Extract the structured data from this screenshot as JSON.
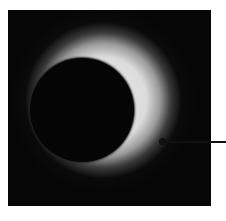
{
  "figure": {
    "colors": {
      "background": "#060606",
      "halo": "#e0e0e0",
      "disc": "#050505",
      "pointer": "#111111",
      "page": "#ffffff"
    },
    "annotation": {
      "label": ""
    }
  }
}
